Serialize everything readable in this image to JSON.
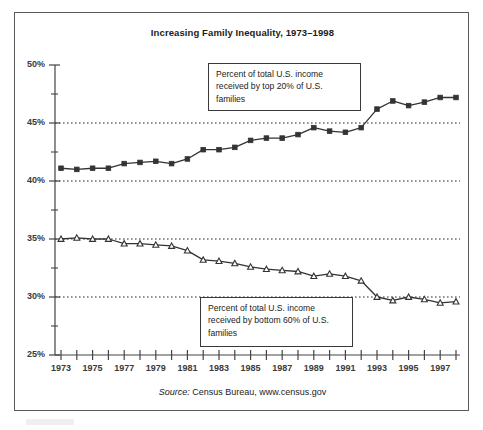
{
  "figure": {
    "title": "Increasing Family Inequality, 1973–1998",
    "source_label": "Source:",
    "source_text": " Census Bureau, www.census.gov",
    "annotation_top": "Percent of total U.S. income received by top 20% of U.S. families",
    "annotation_bottom": "Percent of total U.S. income received by bottom 60% of U.S. families",
    "frame_color": "#5a5a5a",
    "line_color": "#333333",
    "grid_color": "#2b2b2b",
    "axis_color": "#444444"
  },
  "chart_data": {
    "type": "line",
    "title": "Increasing Family Inequality, 1973–1998",
    "xlabel": "",
    "ylabel": "",
    "xlim": [
      1973,
      1998
    ],
    "ylim": [
      25,
      50
    ],
    "ytick_labels": [
      "50%",
      "45%",
      "40%",
      "35%",
      "30%",
      "25%"
    ],
    "ytick_values": [
      50,
      45,
      40,
      35,
      30,
      25
    ],
    "yminor_values": [
      47.5,
      42.5,
      37.5,
      32.5,
      27.5
    ],
    "grid": "horizontal dotted at 45, 40, 35, 30",
    "gridlines": [
      45,
      40,
      35,
      30
    ],
    "legend": "annotation boxes inside plot",
    "x": [
      1973,
      1974,
      1975,
      1976,
      1977,
      1978,
      1979,
      1980,
      1981,
      1982,
      1983,
      1984,
      1985,
      1986,
      1987,
      1988,
      1989,
      1990,
      1991,
      1992,
      1993,
      1994,
      1995,
      1996,
      1997,
      1998
    ],
    "xtick_labels": [
      "1973",
      "",
      "1975",
      "",
      "1977",
      "",
      "1979",
      "",
      "1981",
      "",
      "1983",
      "",
      "1985",
      "",
      "1987",
      "",
      "1989",
      "",
      "1991",
      "",
      "1993",
      "",
      "1995",
      "",
      "1997",
      ""
    ],
    "series": [
      {
        "name": "Percent of total U.S. income received by top 20% of U.S. families",
        "marker": "square",
        "values": [
          41.1,
          41.0,
          41.1,
          41.1,
          41.5,
          41.6,
          41.7,
          41.5,
          41.9,
          42.7,
          42.7,
          42.9,
          43.5,
          43.7,
          43.7,
          44.0,
          44.6,
          44.3,
          44.2,
          44.6,
          46.2,
          46.9,
          46.5,
          46.8,
          47.2,
          47.2
        ]
      },
      {
        "name": "Percent of total U.S. income received by bottom 60% of U.S. families",
        "marker": "triangle",
        "values": [
          35.0,
          35.1,
          35.0,
          35.0,
          34.6,
          34.6,
          34.5,
          34.4,
          34.0,
          33.2,
          33.1,
          32.9,
          32.6,
          32.4,
          32.3,
          32.2,
          31.8,
          32.0,
          31.8,
          31.4,
          30.0,
          29.7,
          30.0,
          29.8,
          29.5,
          29.6
        ]
      }
    ]
  }
}
